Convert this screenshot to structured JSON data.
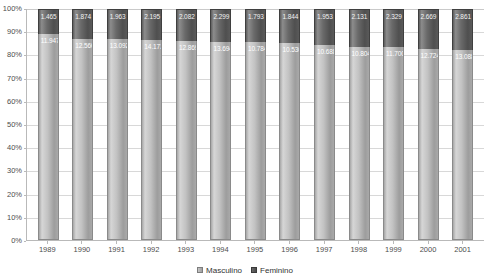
{
  "chart_data": {
    "type": "bar",
    "subtype": "100% stacked column",
    "title": "",
    "xlabel": "",
    "ylabel": "",
    "ylim": [
      0,
      100
    ],
    "ytick_labels": [
      "100%",
      "90%",
      "80%",
      "70%",
      "60%",
      "50%",
      "40%",
      "30%",
      "20%",
      "10%",
      "0%"
    ],
    "ytick_values": [
      100,
      90,
      80,
      70,
      60,
      50,
      40,
      30,
      20,
      10,
      0
    ],
    "grid": true,
    "legend_position": "bottom",
    "categories": [
      "1989",
      "1990",
      "1991",
      "1992",
      "1993",
      "1994",
      "1995",
      "1996",
      "1997",
      "1998",
      "1999",
      "2000",
      "2001"
    ],
    "series": [
      {
        "name": "Masculino",
        "color": "#c2c2c2",
        "values": [
          11947,
          12560,
          13092,
          14172,
          12869,
          13694,
          10784,
          10530,
          10688,
          10804,
          11700,
          12724,
          13088
        ],
        "labels": [
          "11.947",
          "12.560",
          "13.092",
          "14.172",
          "12.869",
          "13.694",
          "10.784",
          "10.530",
          "10.688",
          "10.804",
          "11.700",
          "12.724",
          "13.088"
        ],
        "percent": [
          89.1,
          87.0,
          87.0,
          86.6,
          86.1,
          85.6,
          85.7,
          85.1,
          84.6,
          83.5,
          83.4,
          82.7,
          82.1
        ]
      },
      {
        "name": "Feminino",
        "color": "#5a5a5a",
        "values": [
          1465,
          1874,
          1963,
          2195,
          2082,
          2299,
          1793,
          1844,
          1953,
          2131,
          2329,
          2669,
          2861
        ],
        "labels": [
          "1.465",
          "1.874",
          "1.963",
          "2.195",
          "2.082",
          "2.299",
          "1.793",
          "1.844",
          "1.953",
          "2.131",
          "2.329",
          "2.669",
          "2.861"
        ],
        "percent": [
          10.9,
          13.0,
          13.0,
          13.4,
          13.9,
          14.4,
          14.3,
          14.9,
          15.4,
          16.5,
          16.6,
          17.3,
          17.9
        ]
      }
    ]
  },
  "legend": {
    "items": [
      {
        "label": "Masculino"
      },
      {
        "label": "Feminino"
      }
    ]
  },
  "colors": {
    "series_masculino": "#c2c2c2",
    "series_feminino": "#5a5a5a",
    "gridline": "#d8d8d8",
    "axis": "#b9b9b9",
    "tick_text": "#4d4d4d"
  }
}
